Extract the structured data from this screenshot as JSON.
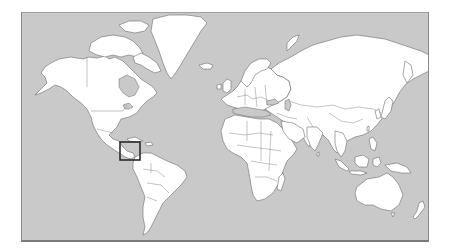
{
  "map": {
    "type": "world-map",
    "projection": "Mercator",
    "colors": {
      "ocean": "#c9c9c9",
      "land": "#ffffff",
      "coastline": "#6b6b6b",
      "frame": "#8a8a8a",
      "highlight": "#2b2b2b"
    },
    "highlight_region": {
      "name": "Central America",
      "x": 119,
      "y": 141,
      "width": 20,
      "height": 18
    },
    "continents": [
      "North America",
      "Greenland",
      "South America",
      "Europe",
      "Africa",
      "Asia",
      "Australia",
      "Antarctica-excluded"
    ]
  }
}
